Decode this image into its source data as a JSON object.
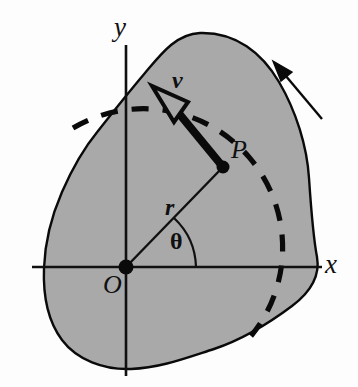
{
  "figure": {
    "colors": {
      "body_fill": "#a9a9a9",
      "outline": "#0a0a0a",
      "axis": "#101010",
      "background": "#fdfdfd",
      "dashed_path": "#0a0a0a"
    }
  },
  "labels": {
    "y_axis": "y",
    "x_axis": "x",
    "origin": "O",
    "point": "P",
    "velocity": "v",
    "radius": "r",
    "angle": "θ"
  },
  "geometry": {
    "origin": {
      "x": 126,
      "y": 267
    },
    "point_p": {
      "x": 223,
      "y": 167
    },
    "velocity_tip": {
      "x": 152,
      "y": 86
    },
    "radius_px": 139,
    "angle_deg": 46,
    "y_axis": {
      "x": 126,
      "top": 45,
      "bottom": 376
    },
    "x_axis": {
      "y": 267,
      "left": 32,
      "right": 322
    },
    "rotation_arrow": {
      "tail_x": 322,
      "tail_y": 119,
      "tip_x": 273,
      "tip_y": 61
    },
    "dashed_arc": {
      "start_x": 73,
      "start_y": 128,
      "end_x": 251,
      "end_y": 336
    }
  },
  "elements": {
    "body_name": "rigid-body-blob",
    "arrow_name": "rotation-direction-arrow",
    "arc_name": "circular-path-dashed-arc",
    "angle_arc_name": "theta-angle-arc"
  }
}
